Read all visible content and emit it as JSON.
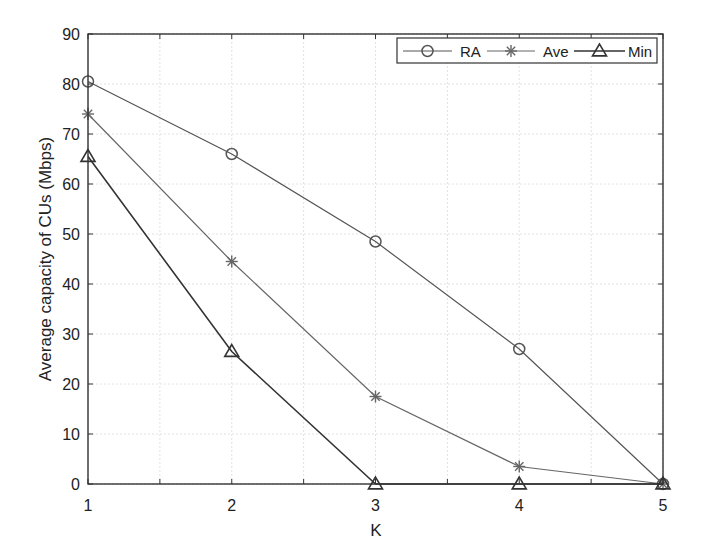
{
  "chart_data": {
    "type": "line",
    "title": "",
    "xlabel": "K",
    "ylabel": "Average capacity of CUs (Mbps)",
    "x": [
      1,
      2,
      3,
      4,
      5
    ],
    "xlim": [
      1,
      5
    ],
    "ylim": [
      0,
      90
    ],
    "xticks": [
      1,
      2,
      3,
      4,
      5
    ],
    "xtick_labels": [
      "1",
      "2",
      "3",
      "4",
      "5"
    ],
    "yticks": [
      0,
      10,
      20,
      30,
      40,
      50,
      60,
      70,
      80,
      90
    ],
    "ytick_labels": [
      "0",
      "10",
      "20",
      "30",
      "40",
      "50",
      "60",
      "70",
      "80",
      "90"
    ],
    "grid": true,
    "legend_position": "top-right (horizontal)",
    "series": [
      {
        "name": "RA",
        "marker": "circle",
        "color": "#555555",
        "values": [
          80.5,
          66,
          48.5,
          27,
          0
        ]
      },
      {
        "name": "Ave",
        "marker": "asterisk",
        "color": "#666666",
        "values": [
          74,
          44.5,
          17.5,
          3.5,
          0
        ]
      },
      {
        "name": "Min",
        "marker": "triangle",
        "color": "#333333",
        "values": [
          65.5,
          26.5,
          0,
          0,
          0
        ]
      }
    ]
  }
}
